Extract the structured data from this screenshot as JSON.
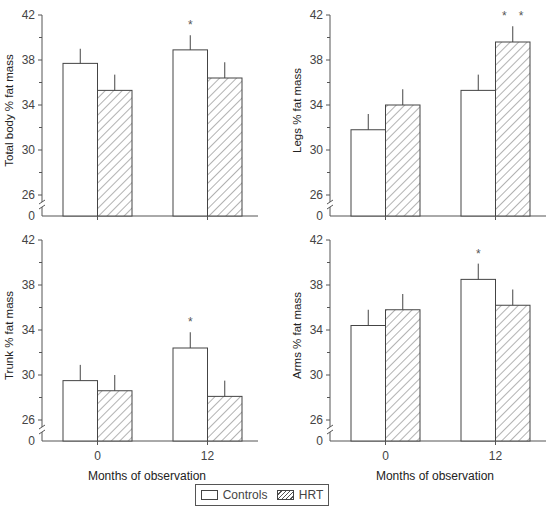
{
  "chart_data": [
    {
      "type": "bar",
      "title": "",
      "ylabel": "Total body % fat mass",
      "xlabel": "",
      "categories": [
        "0",
        "12"
      ],
      "ylim": [
        26,
        42
      ],
      "yticks": [
        0,
        26,
        30,
        34,
        38,
        42
      ],
      "axis_break": true,
      "series": [
        {
          "name": "Controls",
          "values": [
            37.7,
            38.9
          ],
          "error_upper": [
            39.0,
            40.2
          ]
        },
        {
          "name": "HRT",
          "values": [
            35.3,
            36.4
          ],
          "error_upper": [
            36.7,
            37.8
          ]
        }
      ],
      "annotations": [
        {
          "series": "Controls",
          "category": "12",
          "text": "*"
        }
      ]
    },
    {
      "type": "bar",
      "title": "",
      "ylabel": "Legs % fat mass",
      "xlabel": "",
      "categories": [
        "0",
        "12"
      ],
      "ylim": [
        26,
        42
      ],
      "yticks": [
        0,
        26,
        30,
        34,
        38,
        42
      ],
      "axis_break": true,
      "series": [
        {
          "name": "Controls",
          "values": [
            31.8,
            35.3
          ],
          "error_upper": [
            33.2,
            36.7
          ]
        },
        {
          "name": "HRT",
          "values": [
            34.0,
            39.6
          ],
          "error_upper": [
            35.4,
            41.0
          ]
        }
      ],
      "annotations": [
        {
          "series": "HRT",
          "category": "12",
          "text": "* *"
        }
      ]
    },
    {
      "type": "bar",
      "title": "",
      "ylabel": "Trunk % fat mass",
      "xlabel": "Months of observation",
      "categories": [
        "0",
        "12"
      ],
      "ylim": [
        26,
        42
      ],
      "yticks": [
        0,
        26,
        30,
        34,
        38,
        42
      ],
      "axis_break": true,
      "series": [
        {
          "name": "Controls",
          "values": [
            29.5,
            32.4
          ],
          "error_upper": [
            30.9,
            33.8
          ]
        },
        {
          "name": "HRT",
          "values": [
            28.6,
            28.1
          ],
          "error_upper": [
            30.0,
            29.5
          ]
        }
      ],
      "annotations": [
        {
          "series": "Controls",
          "category": "12",
          "text": "*"
        }
      ]
    },
    {
      "type": "bar",
      "title": "",
      "ylabel": "Arms % fat mass",
      "xlabel": "Months of observation",
      "categories": [
        "0",
        "12"
      ],
      "ylim": [
        26,
        42
      ],
      "yticks": [
        0,
        26,
        30,
        34,
        38,
        42
      ],
      "axis_break": true,
      "series": [
        {
          "name": "Controls",
          "values": [
            34.4,
            38.5
          ],
          "error_upper": [
            35.8,
            39.9
          ]
        },
        {
          "name": "HRT",
          "values": [
            35.8,
            36.2
          ],
          "error_upper": [
            37.2,
            37.6
          ]
        }
      ],
      "annotations": [
        {
          "series": "Controls",
          "category": "12",
          "text": "*"
        }
      ]
    }
  ],
  "legend": {
    "items": [
      {
        "label": "Controls",
        "pattern": "open"
      },
      {
        "label": "HRT",
        "pattern": "hatched"
      }
    ]
  },
  "colors": {
    "axis": "#555555",
    "bar_edge": "#444444",
    "hatch": "#555555",
    "background": "#ffffff"
  }
}
